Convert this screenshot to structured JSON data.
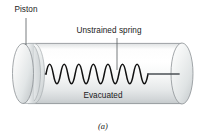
{
  "figure": {
    "caption": "(a)",
    "labels": {
      "piston": "Piston",
      "spring": "Unstrained spring",
      "interior": "Evacuated"
    },
    "colors": {
      "outline": "#8d9295",
      "spring": "#111111",
      "rod": "#4a4f54",
      "leader": "#555a5e",
      "text": "#1a1a1a",
      "cylinder_light": "#ffffff",
      "cylinder_mid": "#f2f3f3",
      "cylinder_shadow": "#c9cdcf",
      "piston_face_light": "#fbfbfb",
      "piston_face_shadow": "#bfc4c7",
      "background": "#ffffff"
    },
    "geometry": {
      "cylinder_left_x": 28,
      "cylinder_right_x": 182,
      "cylinder_top_y": 43,
      "cylinder_bottom_y": 104,
      "cap_rx": 11,
      "cap_ry": 31,
      "spring_coils": 7,
      "spring_center_y": 74
    },
    "parts": [
      {
        "name": "piston-disc",
        "label": "Piston"
      },
      {
        "name": "spring",
        "label": "Unstrained spring"
      },
      {
        "name": "cylinder-interior",
        "label": "Evacuated"
      },
      {
        "name": "end-cap-right",
        "label": ""
      }
    ]
  }
}
